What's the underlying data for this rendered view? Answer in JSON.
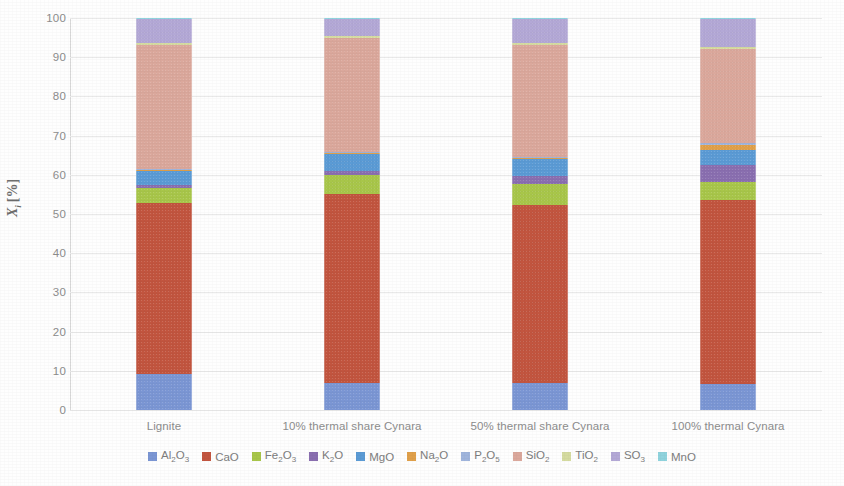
{
  "chart_data": {
    "type": "bar",
    "subtype": "stacked-100-percent",
    "title": "",
    "xlabel": "",
    "ylabel": "Xi [%]",
    "ylim": [
      0,
      100
    ],
    "yticks": [
      0,
      10,
      20,
      30,
      40,
      50,
      60,
      70,
      80,
      90,
      100
    ],
    "ytick_labels": [
      "0",
      "10",
      "20",
      "30",
      "40",
      "50",
      "60",
      "70",
      "80",
      "90",
      "100"
    ],
    "grid": true,
    "grid_axis": "y",
    "legend_position": "bottom",
    "categories": [
      "Lignite",
      "10% thermal share Cynara",
      "50% thermal share Cynara",
      "100% thermal Cynara"
    ],
    "series": [
      {
        "name": "Al₂O₃",
        "color": "#7b96d4",
        "values": [
          9.2,
          6.9,
          6.9,
          6.6
        ]
      },
      {
        "name": "CaO",
        "color": "#c2553f",
        "values": [
          43.6,
          48.2,
          45.4,
          46.9
        ]
      },
      {
        "name": "Fe₂O₃",
        "color": "#a8c64a",
        "values": [
          3.8,
          4.9,
          5.4,
          4.6
        ]
      },
      {
        "name": "K₂O",
        "color": "#8a6fb0",
        "values": [
          0.8,
          1.0,
          2.0,
          4.3
        ]
      },
      {
        "name": "MgO",
        "color": "#5b9bd5",
        "values": [
          3.6,
          4.3,
          4.3,
          3.8
        ]
      },
      {
        "name": "Na₂O",
        "color": "#e0a04a",
        "values": [
          0.3,
          0.3,
          0.3,
          1.5
        ]
      },
      {
        "name": "P₂O₅",
        "color": "#9fb4dc",
        "values": [
          0.2,
          0.2,
          0.3,
          0.5
        ]
      },
      {
        "name": "SiO₂",
        "color": "#dba89c",
        "values": [
          31.5,
          29.0,
          28.5,
          24.0
        ]
      },
      {
        "name": "TiO₂",
        "color": "#d5dba0",
        "values": [
          0.6,
          0.6,
          0.5,
          0.4
        ]
      },
      {
        "name": "SO₃",
        "color": "#b3a8d6",
        "values": [
          6.1,
          4.3,
          6.1,
          7.1
        ]
      },
      {
        "name": "MnO",
        "color": "#8fd3dd",
        "values": [
          0.3,
          0.3,
          0.3,
          0.3
        ]
      }
    ]
  },
  "legend": {
    "items": [
      {
        "label": "Al₂O₃"
      },
      {
        "label": "CaO"
      },
      {
        "label": "Fe₂O₃"
      },
      {
        "label": "K₂O"
      },
      {
        "label": "MgO"
      },
      {
        "label": "Na₂O"
      },
      {
        "label": "P₂O₅"
      },
      {
        "label": "SiO₂"
      },
      {
        "label": "TiO₂"
      },
      {
        "label": "SO₃"
      },
      {
        "label": "MnO"
      }
    ]
  },
  "axis": {
    "y_title_symbol": "X",
    "y_title_sub": "i",
    "y_title_unit": "[%]"
  }
}
